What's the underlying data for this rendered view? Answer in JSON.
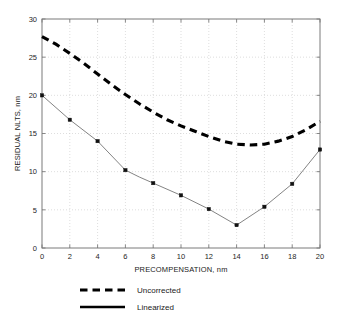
{
  "chart_data": {
    "type": "line",
    "title": "",
    "xlabel": "PRECOMPENSATION, nm",
    "ylabel": "RESIDUAL NLTS, nm",
    "xlim": [
      0,
      20
    ],
    "ylim": [
      0,
      30
    ],
    "xticks": [
      0,
      2,
      4,
      6,
      8,
      10,
      12,
      14,
      16,
      18,
      20
    ],
    "yticks": [
      0,
      5,
      10,
      15,
      20,
      25,
      30
    ],
    "xtick_labels": [
      "0",
      "2",
      "4",
      "6",
      "8",
      "10",
      "12",
      "14",
      "16",
      "18",
      "20"
    ],
    "ytick_labels": [
      "0",
      "5",
      "10",
      "15",
      "20",
      "25",
      "30"
    ],
    "grid": true,
    "legend_position": "below-plot",
    "series": [
      {
        "name": "Uncorrected",
        "style": "dashed",
        "color": "#000000",
        "markers": false,
        "x": [
          0,
          1,
          2,
          3,
          4,
          5,
          6,
          7,
          8,
          9,
          10,
          11,
          12,
          13,
          14,
          15,
          16,
          17,
          18,
          19,
          20
        ],
        "values": [
          27.7,
          26.7,
          25.5,
          24.2,
          22.8,
          21.4,
          20.1,
          18.9,
          17.8,
          16.8,
          16.0,
          15.3,
          14.6,
          14.0,
          13.6,
          13.5,
          13.6,
          14.0,
          14.6,
          15.5,
          16.6
        ]
      },
      {
        "name": "Linearized",
        "style": "solid",
        "color": "#6d6d6d",
        "markers": true,
        "x": [
          0,
          2,
          4,
          6,
          7,
          8,
          10,
          12,
          14,
          16,
          18,
          20
        ],
        "values": [
          20.0,
          16.8,
          14.0,
          10.2,
          9.3,
          8.5,
          6.9,
          5.1,
          3.0,
          5.4,
          8.4,
          12.9
        ]
      }
    ]
  },
  "legend": {
    "entries": [
      {
        "label": "Uncorrected",
        "style": "dashed"
      },
      {
        "label": "Linearized",
        "style": "solid"
      }
    ]
  },
  "axes": {
    "x_title": "PRECOMPENSATION, nm",
    "y_title": "RESIDUAL NLTS, nm"
  }
}
